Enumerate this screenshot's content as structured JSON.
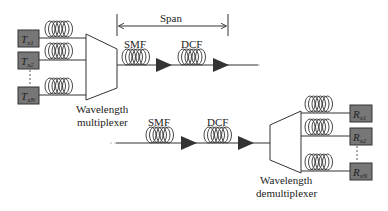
{
  "diagram": {
    "type": "WDM optical transmission link",
    "span_label": "Span",
    "fiber_labels": {
      "smf": "SMF",
      "dcf": "DCF"
    },
    "multiplexer": {
      "line1": "Wavelength",
      "line2": "multiplexer"
    },
    "demultiplexer": {
      "line1": "Wavelength",
      "line2": "demultiplexer"
    },
    "transmitters": [
      {
        "base": "T",
        "sub": "x1"
      },
      {
        "base": "T",
        "sub": "x2"
      },
      {
        "base": "T",
        "sub": "xN"
      }
    ],
    "receivers": [
      {
        "base": "R",
        "sub": "x1"
      },
      {
        "base": "R",
        "sub": "x2"
      },
      {
        "base": "R",
        "sub": "xN"
      }
    ],
    "colors": {
      "box_fill": "#777777",
      "box_stroke": "#333333",
      "line": "#333333",
      "amplifier": "#333333"
    }
  }
}
